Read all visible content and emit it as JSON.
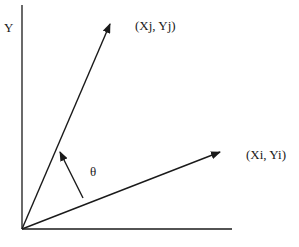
{
  "diagram": {
    "axis_y_label": "Y",
    "vector_j_label": "(Xj, Yj)",
    "vector_i_label": "(Xi, Yi)",
    "angle_label": "θ",
    "line_color": "#1a1a1a"
  }
}
